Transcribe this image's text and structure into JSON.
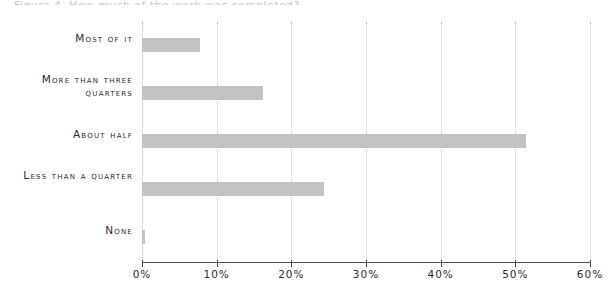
{
  "figure": {
    "clipped_title": "Figure 4.  How much of the work was completed?",
    "background_color": "#ffffff",
    "bar_color": "#c3c3c3",
    "text_color": "#2b2b2b",
    "gridline_color": "#c8c8c8",
    "axis_color": "#4a4a4a"
  },
  "chart_data": {
    "type": "bar",
    "orientation": "horizontal",
    "title": "",
    "xlabel": "",
    "ylabel": "",
    "categories": [
      "Most of it",
      "More than three quarters",
      "About half",
      "Less than a quarter",
      "None"
    ],
    "values": [
      7.8,
      16.2,
      51.4,
      24.4,
      0.4
    ],
    "value_labels": [
      "7.8%",
      "16.2%",
      "51.4%",
      "24.4%",
      "0.4%"
    ],
    "xlim": [
      0,
      60
    ],
    "ylim_categories": 5,
    "xticks": [
      0,
      10,
      20,
      30,
      40,
      50,
      60
    ],
    "xticklabels": [
      "0%",
      "10%",
      "20%",
      "30%",
      "40%",
      "50%",
      "60%"
    ],
    "grid": true,
    "grid_axis": "x",
    "grid_style": "dotted",
    "legend": false,
    "legend_position": "none",
    "series": [
      {
        "name": "Share of respondents",
        "values": [
          7.8,
          16.2,
          51.4,
          24.4,
          0.4
        ]
      }
    ]
  }
}
